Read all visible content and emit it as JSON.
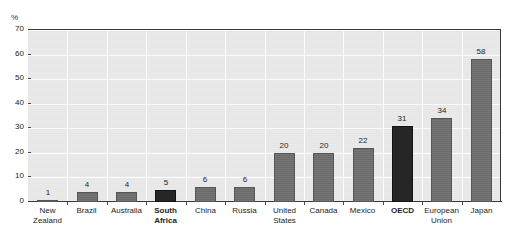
{
  "chart_data": {
    "type": "bar",
    "title": "",
    "subtitle": "",
    "xlabel": "",
    "ylabel": "%",
    "ylim": [
      0,
      70
    ],
    "yticks": [
      0,
      10,
      20,
      30,
      40,
      50,
      60,
      70
    ],
    "ytick_labels": [
      "0",
      "10",
      "20",
      "30",
      "40",
      "50",
      "60",
      "70"
    ],
    "grid": true,
    "legend": "none",
    "categories": [
      "New Zealand",
      "Brazil",
      "Australia",
      "South Africa",
      "China",
      "Russia",
      "United States",
      "Canada",
      "Mexico",
      "OECD",
      "European Union",
      "Japan"
    ],
    "category_lines": [
      [
        "New",
        "Zealand"
      ],
      [
        "Brazil"
      ],
      [
        "Australia"
      ],
      [
        "South",
        "Africa"
      ],
      [
        "China"
      ],
      [
        "Russia"
      ],
      [
        "United",
        "States"
      ],
      [
        "Canada"
      ],
      [
        "Mexico"
      ],
      [
        "OECD"
      ],
      [
        "European",
        "Union"
      ],
      [
        "Japan"
      ]
    ],
    "values": [
      1,
      4,
      4,
      5,
      6,
      6,
      20,
      20,
      22,
      31,
      34,
      58
    ],
    "value_labels": [
      "1",
      "4",
      "4",
      "5",
      "6",
      "6",
      "20",
      "20",
      "22",
      "31",
      "34",
      "58"
    ],
    "highlighted": [
      false,
      false,
      false,
      true,
      false,
      false,
      false,
      false,
      false,
      true,
      false,
      false
    ],
    "colors": {
      "bar": "#6e6e6e",
      "bar_highlight": "#262626",
      "plot_background": "#e9e9e9",
      "gridline": "#fbfbfb",
      "axis": "#3a3a3a",
      "text": "#1d1d1d"
    }
  },
  "axis": {
    "unit_label": "%"
  }
}
